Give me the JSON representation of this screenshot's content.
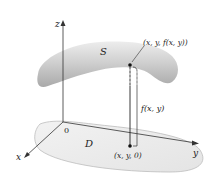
{
  "diagram": {
    "labels": {
      "z_axis": "z",
      "x_axis": "x",
      "y_axis": "y",
      "origin": "0",
      "surface": "S",
      "region": "D",
      "surface_point": "(x, y, f(x, y))",
      "height": "f(x, y)",
      "base_point": "(x, y, 0)"
    },
    "colors": {
      "surface_fill": "#bdbdbd",
      "surface_highlight": "#e6e6e6",
      "region_fill": "#ececec",
      "region_stroke": "#bcbcbc",
      "axis": "#333333",
      "point": "#111111"
    }
  }
}
